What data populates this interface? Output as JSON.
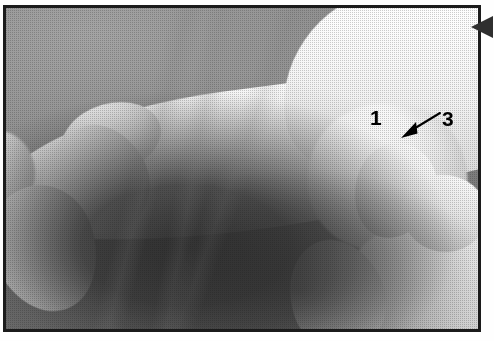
{
  "figure": {
    "kind": "clinical-photograph",
    "frame": {
      "border_color": "#1b1b1b",
      "page_background": "#fefefe"
    },
    "tone": {
      "background_gray": "#8a8a8a",
      "shadow_black": "#1a1a1a",
      "skin_highlight": "#ffffff"
    }
  },
  "annotations": {
    "items": [
      {
        "id": "label-1",
        "text": "1",
        "color": "#000000",
        "has_leader": false
      },
      {
        "id": "label-3",
        "text": "3",
        "color": "#000000",
        "has_leader": true,
        "leader": {
          "type": "arrow",
          "direction": "down-left",
          "color": "#000000"
        }
      }
    ]
  },
  "edge_marker": {
    "name": "left-pointing-triangle",
    "color": "#2f2f2f",
    "direction": "left"
  }
}
